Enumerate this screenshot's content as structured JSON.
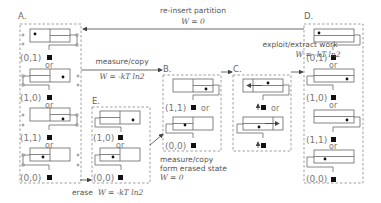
{
  "panels": {
    "A": {
      "label": "A."
    },
    "B": {
      "label": "B."
    },
    "C": {
      "label": "C."
    },
    "D": {
      "label": "D."
    },
    "E": {
      "label": "E."
    }
  },
  "states": {
    "s01": "(0,1)",
    "s10": "(1,0)",
    "s11": "(1,1)",
    "s00": "(0,0)"
  },
  "or_label": "or",
  "transitions": {
    "reinsert": {
      "caption": "re-insert partition",
      "work": "W = 0"
    },
    "measure_copy": {
      "caption": "measure/copy",
      "work": "W = -kT ln2"
    },
    "exploit": {
      "caption": "exploit/extract work",
      "work": "W = -kT ln2"
    },
    "erase": {
      "caption": "erase",
      "work": "W = -kT ln2"
    },
    "measure_erased": {
      "caption_line1": "measure/copy",
      "caption_line2": "form erased state",
      "work": "W = 0"
    }
  }
}
